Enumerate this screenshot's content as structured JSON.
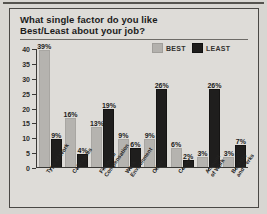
{
  "title": "What single factor do you like Best/Least about your job?",
  "title_line1": "What single factor do you like",
  "title_line2": "Best/Least about your job?",
  "legend": {
    "best_label": "BEST",
    "least_label": "LEAST",
    "best_color": "#b5b3af",
    "least_color": "#1f1e1d"
  },
  "chart_data": {
    "type": "bar",
    "title": "What single factor do you like Best/Least about your job?",
    "xlabel": "",
    "ylabel": "",
    "ylim": [
      0,
      40
    ],
    "yticks": [
      0,
      5,
      10,
      15,
      20,
      25,
      30,
      35,
      40
    ],
    "ytick_labels": [
      "0",
      "5",
      "10",
      "15",
      "20",
      "25",
      "30",
      "35",
      "40"
    ],
    "grid": false,
    "legend_position": "top-right",
    "categories": [
      "Type of Work",
      "Colleagues",
      "Financial Compensation",
      "Work Environment",
      "Other",
      "Career",
      "Amount of Work",
      "Benefits and Perks"
    ],
    "category_lines": [
      [
        "Type of Work"
      ],
      [
        "Colleagues"
      ],
      [
        "Financial",
        "Compensation"
      ],
      [
        "Work",
        "Environment"
      ],
      [
        "Other"
      ],
      [
        "Career"
      ],
      [
        "Amount",
        "of Work"
      ],
      [
        "Benefits",
        "and Perks"
      ]
    ],
    "series": [
      {
        "name": "BEST",
        "color": "#b5b3af",
        "values": [
          39,
          16,
          13,
          9,
          9,
          6,
          3,
          3
        ],
        "labels": [
          "39%",
          "16%",
          "13%",
          "9%",
          "9%",
          "6%",
          "3%",
          "3%"
        ]
      },
      {
        "name": "LEAST",
        "color": "#1f1e1d",
        "values": [
          9,
          4,
          19,
          6,
          26,
          2,
          26,
          7
        ],
        "labels": [
          "9%",
          "4%",
          "19%",
          "6%",
          "26%",
          "2%",
          "26%",
          "7%"
        ]
      }
    ]
  }
}
